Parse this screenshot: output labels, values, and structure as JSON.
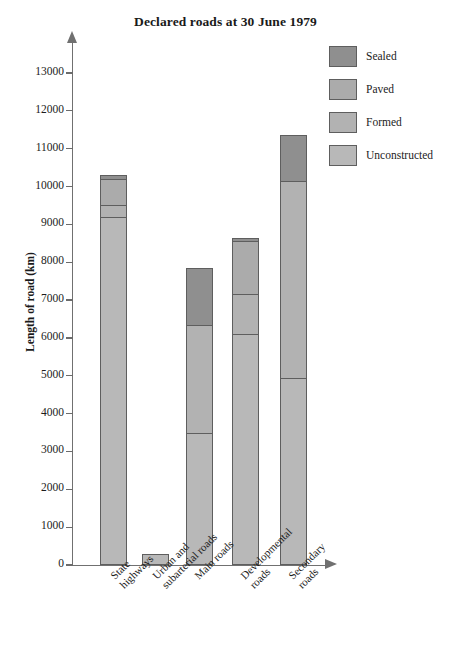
{
  "chart_data": {
    "type": "bar",
    "subtype": "stacked-bar",
    "title": "Declared roads at 30 June 1979",
    "xlabel": "",
    "ylabel": "Length of road (km)",
    "ylim": [
      0,
      13500
    ],
    "grid": false,
    "legend_position": "top-right",
    "y_ticks": [
      0,
      1000,
      2000,
      3000,
      4000,
      5000,
      6000,
      7000,
      8000,
      9000,
      10000,
      11000,
      12000,
      13000
    ],
    "y_tick_labels": [
      "0",
      "1000",
      "2000",
      "3000",
      "4000",
      "5000",
      "6000",
      "7000",
      "8000",
      "9000",
      "10000",
      "11000",
      "12000",
      "13000"
    ],
    "categories": [
      "State highways",
      "Urban and subarterial roads",
      "Main roads",
      "Developmental roads",
      "Secondary roads"
    ],
    "category_lines": [
      [
        "State",
        "highways"
      ],
      [
        "Urban and",
        "subarterial roads"
      ],
      [
        "Main roads"
      ],
      [
        "Developmental",
        "roads"
      ],
      [
        "Secondary",
        "roads"
      ]
    ],
    "series": [
      {
        "name": "Sealed",
        "color": "#8f8f8f",
        "values": [
          100,
          0,
          1500,
          100,
          1200
        ]
      },
      {
        "name": "Paved",
        "color": "#ababab",
        "values": [
          700,
          0,
          0,
          1400,
          0
        ]
      },
      {
        "name": "Formed",
        "color": "#b2b2b2",
        "values": [
          300,
          0,
          2850,
          1050,
          5200
        ]
      },
      {
        "name": "Unconstructed",
        "color": "#b8b8b8",
        "values": [
          9200,
          300,
          3500,
          6100,
          4950
        ]
      }
    ],
    "totals": [
      10300,
      300,
      7850,
      8650,
      11350
    ],
    "bar_tops": [
      10300,
      300,
      8200,
      8650,
      13200
    ],
    "stack_order_bottom_to_top": [
      "Unconstructed",
      "Formed",
      "Paved",
      "Sealed"
    ]
  },
  "legend": {
    "items": [
      {
        "label": "Sealed",
        "color": "#8f8f8f"
      },
      {
        "label": "Paved",
        "color": "#ababab"
      },
      {
        "label": "Formed",
        "color": "#b2b2b2"
      },
      {
        "label": "Unconstructed",
        "color": "#b8b8b8"
      }
    ]
  },
  "axis": {
    "y_title": "Length of road (km)"
  }
}
